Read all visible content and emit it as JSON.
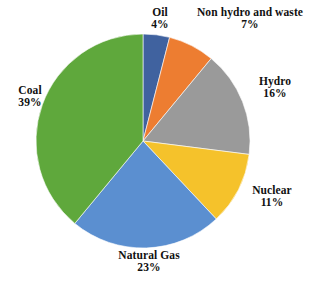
{
  "chart_data": {
    "type": "pie",
    "title": "",
    "subtitle": "",
    "xlabel": "",
    "ylabel": "",
    "legend_position": "none",
    "grid": false,
    "labels_outside": true,
    "start_angle_deg": 0,
    "direction": "clockwise",
    "units": "percent",
    "total": 100,
    "categories": [
      "Oil",
      "Non hydro and waste",
      "Hydro",
      "Nuclear",
      "Natural Gas",
      "Coal"
    ],
    "values": [
      4,
      7,
      16,
      11,
      23,
      39
    ],
    "value_labels": [
      "4%",
      "7%",
      "16%",
      "11%",
      "23%",
      "39%"
    ],
    "colors": [
      "#40629F",
      "#ED7D31",
      "#9A9A9A",
      "#F5C22B",
      "#5B8FD0",
      "#5FA83C"
    ],
    "slices": [
      {
        "name": "Oil",
        "value": 4,
        "value_label": "4%",
        "color": "#40629F",
        "label_id": "label-oil"
      },
      {
        "name": "Non hydro and waste",
        "value": 7,
        "value_label": "7%",
        "color": "#ED7D31",
        "label_id": "label-nonhydro"
      },
      {
        "name": "Hydro",
        "value": 16,
        "value_label": "16%",
        "color": "#9A9A9A",
        "label_id": "label-hydro"
      },
      {
        "name": "Nuclear",
        "value": 11,
        "value_label": "11%",
        "color": "#F5C22B",
        "label_id": "label-nuclear"
      },
      {
        "name": "Natural Gas",
        "value": 23,
        "value_label": "23%",
        "color": "#5B8FD0",
        "label_id": "label-naturalgas"
      },
      {
        "name": "Coal",
        "value": 39,
        "value_label": "39%",
        "color": "#5FA83C",
        "label_id": "label-coal"
      }
    ],
    "geometry": {
      "center_x": 143,
      "center_y": 141,
      "radius": 107,
      "edge_color": "#ffffff",
      "edge_width": 0.6
    },
    "background": "#ffffff"
  }
}
